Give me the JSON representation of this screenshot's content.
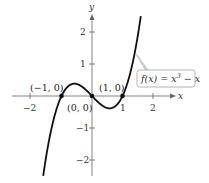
{
  "chart_data": {
    "type": "line",
    "title": "",
    "function": "f(x) = x^3 - x",
    "xlabel": "x",
    "ylabel": "y",
    "xlim": [
      -2.4,
      2.4
    ],
    "ylim": [
      -2.6,
      2.7
    ],
    "x_ticks": [
      -2,
      1,
      2
    ],
    "x_tick_labels": [
      "−2",
      "1",
      "2"
    ],
    "y_ticks": [
      2,
      1,
      -1,
      -2
    ],
    "y_tick_labels": [
      "2",
      "1",
      "−1",
      "−2"
    ],
    "grid": false,
    "series": [
      {
        "name": "f(x) = x^3 - x",
        "x": [
          -1.6,
          -1.2,
          -1.0,
          -0.577,
          0,
          0.577,
          1.0,
          1.2,
          1.6
        ],
        "y": [
          -2.496,
          -0.528,
          0,
          0.385,
          0,
          -0.385,
          0,
          0.528,
          2.496
        ]
      }
    ],
    "points": [
      {
        "label": "(−1, 0)",
        "x": -1,
        "y": 0
      },
      {
        "label": "(0, 0)",
        "x": 0,
        "y": 0
      },
      {
        "label": "(1, 0)",
        "x": 1,
        "y": 0
      }
    ],
    "annotations": [
      {
        "text": "f(x) = x³ − x",
        "type": "callout"
      }
    ]
  },
  "labels": {
    "x_axis": "x",
    "y_axis": "y",
    "tick_neg2": "−2",
    "tick_1": "1",
    "tick_2": "2",
    "ytick_2": "2",
    "ytick_1": "1",
    "ytick_neg1": "−1",
    "ytick_neg2": "−2",
    "pt_neg1": "(−1, 0)",
    "pt_0": "(0, 0)",
    "pt_1": "(1, 0)",
    "fn_prefix": "f(x) = x",
    "fn_exp": "3",
    "fn_suffix": " − x"
  }
}
